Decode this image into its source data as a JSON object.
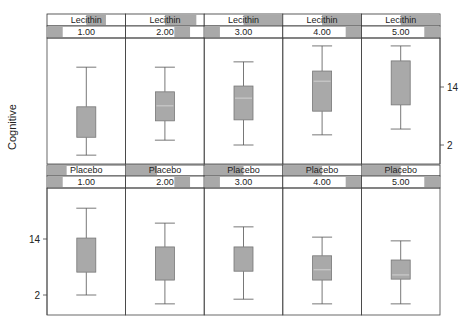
{
  "chart_data": {
    "type": "boxplot",
    "title": "",
    "xlabel": "",
    "ylabel": "Cognitive",
    "layout": {
      "rows": 2,
      "cols": 5,
      "strip_position": "top",
      "grid": false
    },
    "colors": {
      "box_fill": "#a9a9a9",
      "strip_shade": "#a9a9a9",
      "line": "#555555",
      "median": "#dcdcdc"
    },
    "panels": [
      {
        "group": "Lecithin",
        "y_ticks": [
          2,
          14
        ],
        "y_axis_side": "right",
        "ylim": [
          -1.8,
          24.3
        ],
        "cells": [
          {
            "strip": "Lecithin",
            "level": "1.00",
            "whisker_low": -0.1,
            "q1": 3.6,
            "median": null,
            "q3": 9.9,
            "whisker_high": 18.1
          },
          {
            "strip": "Lecithin",
            "level": "2.00",
            "whisker_low": 3.0,
            "q1": 7.0,
            "median": 10.1,
            "q3": 13.0,
            "whisker_high": 18.1
          },
          {
            "strip": "Lecithin",
            "level": "3.00",
            "whisker_low": 2.0,
            "q1": 7.2,
            "median": 11.7,
            "q3": 14.2,
            "whisker_high": 19.2
          },
          {
            "strip": "Lecithin",
            "level": "4.00",
            "whisker_low": 4.1,
            "q1": 9.0,
            "median": 15.2,
            "q3": 17.3,
            "whisker_high": 22.5
          },
          {
            "strip": "Lecithin",
            "level": "5.00",
            "whisker_low": 5.3,
            "q1": 10.3,
            "median": null,
            "q3": 19.4,
            "whisker_high": 22.5
          }
        ]
      },
      {
        "group": "Placebo",
        "y_ticks": [
          2,
          14
        ],
        "y_axis_side": "left",
        "ylim": [
          -2.3,
          24.9
        ],
        "cells": [
          {
            "strip": "Placebo",
            "level": "1.00",
            "whisker_low": 2.0,
            "q1": 6.9,
            "median": null,
            "q3": 14.2,
            "whisker_high": 20.6
          },
          {
            "strip": "Placebo",
            "level": "2.00",
            "whisker_low": 0.1,
            "q1": 5.2,
            "median": null,
            "q3": 12.3,
            "whisker_high": 17.4
          },
          {
            "strip": "Placebo",
            "level": "3.00",
            "whisker_low": 1.1,
            "q1": 7.1,
            "median": null,
            "q3": 12.3,
            "whisker_high": 16.6
          },
          {
            "strip": "Placebo",
            "level": "4.00",
            "whisker_low": 0.1,
            "q1": 5.2,
            "median": 7.4,
            "q3": 10.4,
            "whisker_high": 14.4
          },
          {
            "strip": "Placebo",
            "level": "5.00",
            "whisker_low": 0.1,
            "q1": 5.4,
            "median": 6.3,
            "q3": 9.5,
            "whisker_high": 13.6
          }
        ]
      }
    ]
  }
}
